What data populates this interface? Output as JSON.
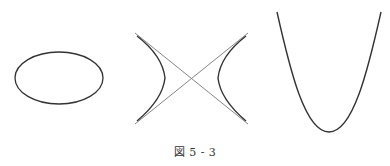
{
  "figure": {
    "caption": "図 5 - 3",
    "stroke_color": "#333333",
    "asymptote_color": "#777777",
    "panels": [
      {
        "name": "ellipse",
        "cx": 59,
        "cy": 78,
        "rx": 44,
        "ry": 26
      },
      {
        "name": "hyperbola",
        "center": [
          191,
          78
        ],
        "vertex_offset": 26,
        "asymptotes": [
          [
            [
              135,
              33
            ],
            [
              248,
              124
            ]
          ],
          [
            [
              248,
              33
            ],
            [
              135,
              124
            ]
          ]
        ]
      },
      {
        "name": "parabola",
        "vertex": [
          329,
          132
        ],
        "endpoints": [
          [
            277,
            12
          ],
          [
            381,
            12
          ]
        ]
      }
    ]
  }
}
